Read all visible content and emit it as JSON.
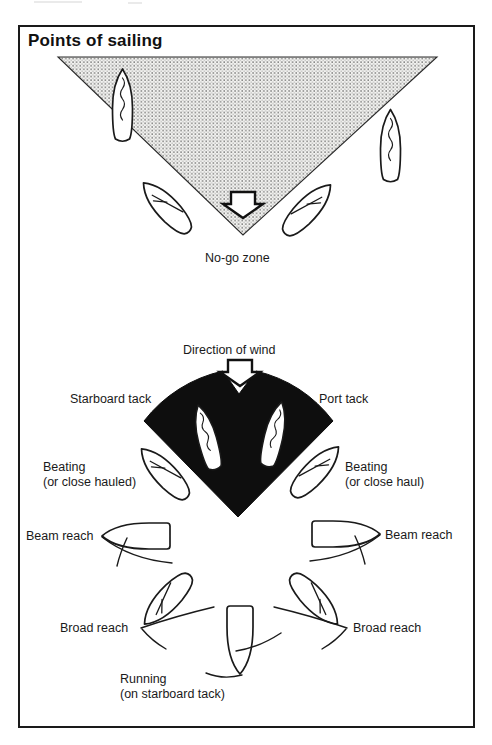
{
  "figure": {
    "title": "Points of sailing",
    "no_go_zone": {
      "label": "No-go zone"
    },
    "wind": {
      "label": "Direction of wind"
    },
    "tacks": {
      "starboard": "Starboard tack",
      "port": "Port tack"
    },
    "points": {
      "beating_left": {
        "line1": "Beating",
        "line2": "(or close hauled)"
      },
      "beating_right": {
        "line1": "Beating",
        "line2": "(or close haul)"
      },
      "beam_reach_left": "Beam reach",
      "beam_reach_right": "Beam reach",
      "broad_reach_left": "Broad reach",
      "broad_reach_right": "Broad reach",
      "running": {
        "line1": "Running",
        "line2": "(on starboard tack)"
      }
    },
    "icons": {
      "wind_arrow": "down-arrow",
      "no_go_arrow": "down-arrow"
    },
    "colors": {
      "ink": "#1a1a1a",
      "fan_fill": "#0e0e0e",
      "stipple_dot": "#4a4a4a",
      "stipple_bg": "#f3f3f1",
      "paper": "#ffffff"
    }
  }
}
